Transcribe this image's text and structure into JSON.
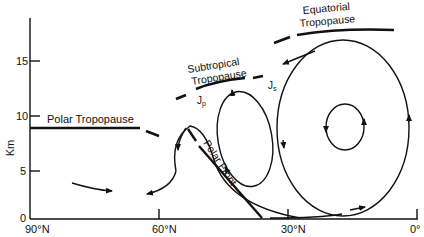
{
  "diagram": {
    "y_axis": {
      "label": "Km",
      "ticks": [
        "0",
        "5",
        "10",
        "15"
      ]
    },
    "x_axis": {
      "ticks": [
        "90°N",
        "60°N",
        "30°N",
        "0°"
      ]
    },
    "labels": {
      "polar_tropopause": "Polar Tropopause",
      "subtropical_line1": "Subtropical",
      "subtropical_line2": "Tropopause",
      "equatorial_line1": "Equatorial",
      "equatorial_line2": "Tropopause",
      "polar_front": "Polar Front",
      "jet_polar": "J",
      "jet_polar_sub": "p",
      "jet_subtropical": "J",
      "jet_subtropical_sub": "s"
    },
    "colors": {
      "ink": "#111111",
      "background": "#ffffff"
    }
  }
}
